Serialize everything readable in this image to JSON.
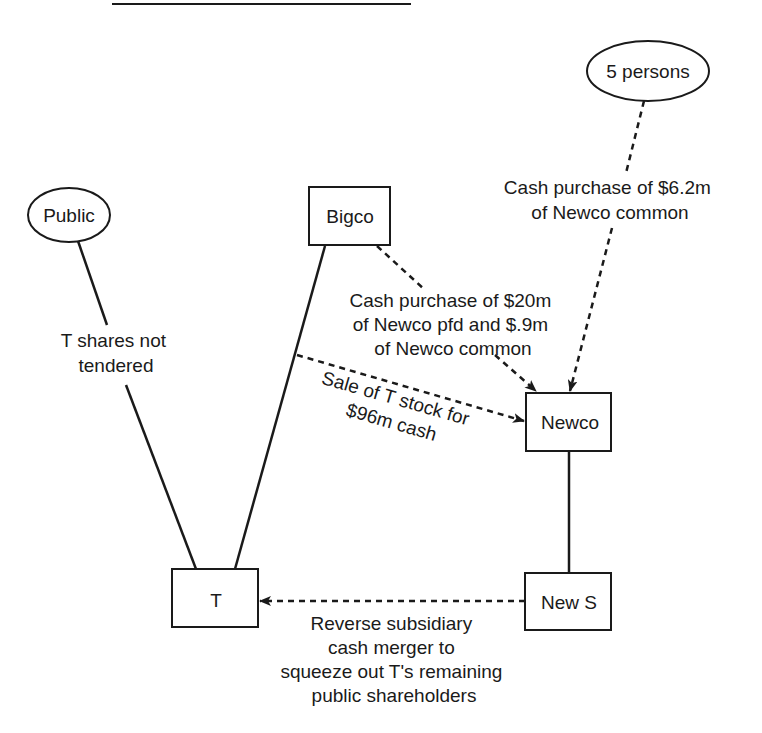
{
  "diagram": {
    "type": "transaction-structure",
    "nodes": {
      "public": {
        "label": "Public",
        "shape": "ellipse"
      },
      "five": {
        "label": "5 persons",
        "shape": "ellipse"
      },
      "bigco": {
        "label": "Bigco",
        "shape": "box"
      },
      "newco": {
        "label": "Newco",
        "shape": "box"
      },
      "t": {
        "label": "T",
        "shape": "box"
      },
      "news": {
        "label": "New S",
        "shape": "box"
      }
    },
    "edges": {
      "public_t": {
        "from": "Public",
        "to": "T",
        "style": "solid",
        "lines": [
          "T shares not",
          "tendered"
        ]
      },
      "bigco_t": {
        "from": "Bigco",
        "to": "T",
        "style": "solid"
      },
      "five_newco": {
        "from": "5 persons",
        "to": "Newco",
        "style": "dashed-arrow",
        "lines": [
          "Cash purchase of $6.2m",
          "of Newco common"
        ]
      },
      "bigco_newco": {
        "from": "Bigco",
        "to": "Newco",
        "style": "dashed-arrow",
        "lines": [
          "Cash purchase of $20m",
          "of Newco pfd and $.9m",
          "of Newco common"
        ]
      },
      "sale": {
        "from": "Bigco-T line",
        "to": "Newco",
        "style": "dashed-arrow",
        "lines": [
          "Sale of T stock for",
          "$96m cash"
        ]
      },
      "newco_news": {
        "from": "Newco",
        "to": "New S",
        "style": "solid"
      },
      "merger": {
        "from": "New S",
        "to": "T",
        "style": "dashed-arrow",
        "lines": [
          "Reverse subsidiary",
          "cash merger to",
          "squeeze out T's remaining",
          "public shareholders"
        ]
      }
    },
    "colors": {
      "ink": "#1a1a1a",
      "background": "#ffffff"
    }
  }
}
